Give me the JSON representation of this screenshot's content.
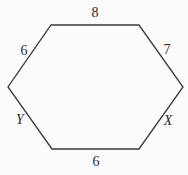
{
  "diagram": {
    "shape": "hexagon",
    "stroke_color": "#3a3a3a",
    "background_color": "#fbfbfb",
    "vertices": [
      {
        "name": "top-left",
        "x": 51,
        "y": 25
      },
      {
        "name": "top-right",
        "x": 139,
        "y": 25
      },
      {
        "name": "right",
        "x": 183,
        "y": 87
      },
      {
        "name": "bottom-right",
        "x": 139,
        "y": 149
      },
      {
        "name": "bottom-left",
        "x": 52,
        "y": 149
      },
      {
        "name": "left",
        "x": 8,
        "y": 87
      }
    ],
    "side_labels": {
      "top": {
        "text": "8",
        "x": 95,
        "y": 13,
        "italic": false
      },
      "upper_right": {
        "text": "7",
        "x": 167,
        "y": 50,
        "italic": false
      },
      "lower_right": {
        "text": "X",
        "x": 168,
        "y": 121,
        "italic": true
      },
      "bottom": {
        "text": "6",
        "x": 96,
        "y": 162,
        "italic": false
      },
      "lower_left": {
        "text": "Y",
        "x": 20,
        "y": 120,
        "italic": true
      },
      "upper_left": {
        "text": "6",
        "x": 24,
        "y": 51,
        "italic": false
      }
    }
  }
}
